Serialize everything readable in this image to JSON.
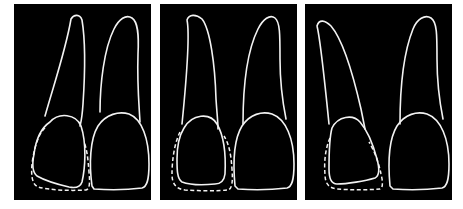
{
  "figure": {
    "panels": [
      {
        "id": "panel-1",
        "label": "",
        "description": "Lateral incisor and central incisor outlines; dashed contour shows original lateral incisor crown outline, lateral incisor crown smaller and tilted",
        "teeth": [
          "lateral-incisor",
          "central-incisor"
        ],
        "dashed_outline": true
      },
      {
        "id": "panel-2",
        "label": "",
        "description": "Lateral incisor crown reduced within dashed original contour; upright root",
        "teeth": [
          "lateral-incisor",
          "central-incisor"
        ],
        "dashed_outline": true
      },
      {
        "id": "panel-3",
        "label": "",
        "description": "Lateral incisor with distally inclined root; dashed original contour around crown",
        "teeth": [
          "lateral-incisor",
          "central-incisor"
        ],
        "dashed_outline": true
      }
    ],
    "colors": {
      "background": "#000000",
      "stroke": "#f2f2f2",
      "page": "#ffffff"
    }
  }
}
